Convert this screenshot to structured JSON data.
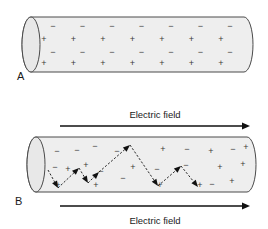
{
  "figure": {
    "title_visible": false,
    "background_color": "#ffffff",
    "cylinder_fill": "#eeeeee",
    "cylinder_stroke": "#4a4a4a",
    "arrow_color": "#111111",
    "charge_color": "#3a3a3a"
  },
  "panels": [
    {
      "id": "panel-a",
      "label": "A",
      "label_x": 17,
      "label_y": 80,
      "cylinder": {
        "left": 22,
        "right": 253,
        "top": 17,
        "bottom": 72,
        "cap_rx": 9,
        "cap_ry": 27.5
      },
      "charge_rows": [
        {
          "sign": "−",
          "y": 27,
          "x_start": 53,
          "spacing": 29.5,
          "count": 7
        },
        {
          "sign": "+",
          "y": 40,
          "x_start": 44,
          "spacing": 29.5,
          "count": 7
        },
        {
          "sign": "−",
          "y": 53,
          "x_start": 53,
          "spacing": 29.5,
          "count": 7
        },
        {
          "sign": "+",
          "y": 64,
          "x_start": 44,
          "spacing": 29.5,
          "count": 7
        }
      ],
      "field_arrows": []
    },
    {
      "id": "panel-b",
      "label": "B",
      "label_x": 15,
      "label_y": 205,
      "cylinder": {
        "left": 27,
        "right": 256,
        "top": 137,
        "bottom": 192,
        "cap_rx": 9,
        "cap_ry": 27.5
      },
      "charge_rows": [],
      "scattered_charges": [
        {
          "sign": "−",
          "x": 57,
          "y": 152
        },
        {
          "sign": "−",
          "x": 77,
          "y": 151
        },
        {
          "sign": "−",
          "x": 95,
          "y": 147
        },
        {
          "sign": "−",
          "x": 117,
          "y": 152
        },
        {
          "sign": "+",
          "y": 150,
          "x": 163
        },
        {
          "sign": "−",
          "x": 187,
          "y": 150
        },
        {
          "sign": "+",
          "x": 211,
          "y": 152
        },
        {
          "sign": "−",
          "x": 233,
          "y": 150
        },
        {
          "sign": "+",
          "x": 246,
          "y": 148
        },
        {
          "sign": "−",
          "x": 55,
          "y": 168
        },
        {
          "sign": "+",
          "x": 68,
          "y": 170
        },
        {
          "sign": "+",
          "x": 86,
          "y": 166
        },
        {
          "sign": "−",
          "x": 101,
          "y": 172
        },
        {
          "sign": "+",
          "x": 133,
          "y": 168
        },
        {
          "sign": "−",
          "x": 157,
          "y": 170
        },
        {
          "sign": "−",
          "x": 186,
          "y": 166
        },
        {
          "sign": "+",
          "x": 220,
          "y": 168
        },
        {
          "sign": "+",
          "x": 243,
          "y": 165
        },
        {
          "sign": "−",
          "x": 123,
          "y": 179
        },
        {
          "sign": "+",
          "x": 58,
          "y": 186
        },
        {
          "sign": "+",
          "x": 96,
          "y": 186
        },
        {
          "sign": "+",
          "x": 160,
          "y": 186
        },
        {
          "sign": "+",
          "x": 200,
          "y": 186
        },
        {
          "sign": "−",
          "x": 212,
          "y": 185
        },
        {
          "sign": "+",
          "x": 232,
          "y": 182
        }
      ],
      "electron_path": {
        "description": "zigzag scattering path of an electron drifting against the field",
        "vertices": [
          [
            48,
            170
          ],
          [
            58,
            188
          ],
          [
            79,
            168
          ],
          [
            88,
            183
          ],
          [
            99,
            172
          ],
          [
            130,
            145
          ],
          [
            158,
            186
          ],
          [
            181,
            166
          ],
          [
            198,
            187
          ]
        ]
      },
      "field_arrows": [
        {
          "id": "top-arrow",
          "x1": 60,
          "x2": 250,
          "y": 126
        },
        {
          "id": "bottom-arrow",
          "x1": 60,
          "x2": 250,
          "y": 206
        }
      ],
      "field_labels": [
        {
          "id": "top-field-label",
          "text": "Electric field",
          "x": 155,
          "y": 118
        },
        {
          "id": "bottom-field-label",
          "text": "Electric field",
          "x": 155,
          "y": 224
        }
      ]
    }
  ]
}
